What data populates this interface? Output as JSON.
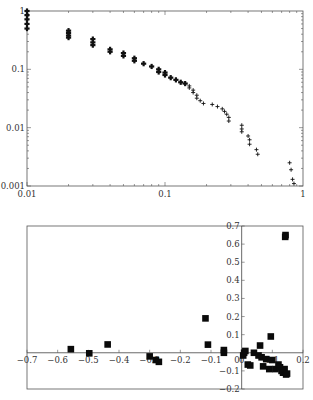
{
  "chart_data": [
    {
      "type": "scatter",
      "title": "",
      "xlabel": "",
      "ylabel": "",
      "xscale": "log",
      "yscale": "log",
      "xlim": [
        0.01,
        1
      ],
      "ylim": [
        0.001,
        1
      ],
      "grid": false,
      "marker": "plus",
      "x_ticks": [
        "0.01",
        "0.1",
        "1"
      ],
      "y_ticks": [
        "0.001",
        "0.01",
        "0.1",
        "1"
      ],
      "points": [
        [
          0.01,
          1.0
        ],
        [
          0.01,
          0.85
        ],
        [
          0.01,
          0.72
        ],
        [
          0.01,
          0.6
        ],
        [
          0.01,
          0.5
        ],
        [
          0.02,
          0.46
        ],
        [
          0.02,
          0.42
        ],
        [
          0.02,
          0.38
        ],
        [
          0.02,
          0.35
        ],
        [
          0.03,
          0.33
        ],
        [
          0.03,
          0.29
        ],
        [
          0.03,
          0.26
        ],
        [
          0.04,
          0.22
        ],
        [
          0.04,
          0.2
        ],
        [
          0.05,
          0.19
        ],
        [
          0.05,
          0.17
        ],
        [
          0.06,
          0.155
        ],
        [
          0.06,
          0.14
        ],
        [
          0.07,
          0.125
        ],
        [
          0.08,
          0.112
        ],
        [
          0.09,
          0.1
        ],
        [
          0.09,
          0.09
        ],
        [
          0.1,
          0.088
        ],
        [
          0.1,
          0.08
        ],
        [
          0.11,
          0.072
        ],
        [
          0.12,
          0.066
        ],
        [
          0.13,
          0.06
        ],
        [
          0.14,
          0.057
        ],
        [
          0.15,
          0.052
        ],
        [
          0.15,
          0.048
        ],
        [
          0.16,
          0.044
        ],
        [
          0.16,
          0.04
        ],
        [
          0.17,
          0.036
        ],
        [
          0.17,
          0.032
        ],
        [
          0.18,
          0.029
        ],
        [
          0.19,
          0.026
        ],
        [
          0.22,
          0.025
        ],
        [
          0.24,
          0.023
        ],
        [
          0.26,
          0.021
        ],
        [
          0.27,
          0.019
        ],
        [
          0.28,
          0.017
        ],
        [
          0.29,
          0.015
        ],
        [
          0.29,
          0.013
        ],
        [
          0.36,
          0.011
        ],
        [
          0.36,
          0.0095
        ],
        [
          0.36,
          0.0085
        ],
        [
          0.4,
          0.0072
        ],
        [
          0.41,
          0.0062
        ],
        [
          0.41,
          0.0052
        ],
        [
          0.46,
          0.0042
        ],
        [
          0.47,
          0.0035
        ],
        [
          0.8,
          0.0025
        ],
        [
          0.82,
          0.0019
        ],
        [
          0.84,
          0.0013
        ],
        [
          0.86,
          0.0011
        ]
      ]
    },
    {
      "type": "scatter",
      "title": "",
      "xlabel": "",
      "ylabel": "",
      "xlim": [
        -0.7,
        0.2
      ],
      "ylim": [
        -0.2,
        0.7
      ],
      "grid": false,
      "marker": "square",
      "axes_through_origin": true,
      "x_ticks": [
        "-0.7",
        "-0.6",
        "-0.5",
        "-0.4",
        "-0.3",
        "-0.2",
        "-0.1",
        "0",
        "0.1",
        "0.2"
      ],
      "y_ticks": [
        "-0.2",
        "-0.1",
        "0",
        "0.1",
        "0.2",
        "0.3",
        "0.4",
        "0.5",
        "0.6",
        "0.7"
      ],
      "points": [
        [
          -0.557,
          0.02
        ],
        [
          -0.497,
          -0.003
        ],
        [
          -0.437,
          0.046
        ],
        [
          -0.3,
          -0.02
        ],
        [
          -0.28,
          -0.04
        ],
        [
          -0.27,
          -0.05
        ],
        [
          -0.118,
          0.19
        ],
        [
          -0.11,
          0.045
        ],
        [
          -0.058,
          0.0
        ],
        [
          -0.058,
          0.015
        ],
        [
          0.005,
          -0.015
        ],
        [
          0.008,
          0.0
        ],
        [
          0.012,
          0.01
        ],
        [
          0.02,
          -0.065
        ],
        [
          0.028,
          -0.07
        ],
        [
          0.04,
          0.0
        ],
        [
          0.055,
          -0.015
        ],
        [
          0.06,
          0.04
        ],
        [
          0.065,
          -0.025
        ],
        [
          0.07,
          -0.075
        ],
        [
          0.08,
          -0.035
        ],
        [
          0.09,
          -0.09
        ],
        [
          0.095,
          0.09
        ],
        [
          0.1,
          -0.04
        ],
        [
          0.11,
          -0.09
        ],
        [
          0.12,
          -0.065
        ],
        [
          0.125,
          -0.08
        ],
        [
          0.13,
          -0.1
        ],
        [
          0.135,
          -0.11
        ],
        [
          0.14,
          -0.09
        ],
        [
          0.145,
          -0.12
        ],
        [
          0.148,
          -0.115
        ],
        [
          0.142,
          0.64
        ],
        [
          0.143,
          0.65
        ]
      ]
    }
  ]
}
